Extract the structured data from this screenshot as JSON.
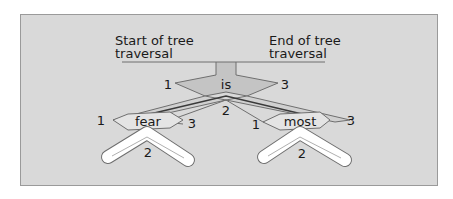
{
  "diagram": {
    "start_label_line1": "Start of tree",
    "start_label_line2": "traversal",
    "end_label_line1": "End of tree",
    "end_label_line2": "traversal",
    "nodes": [
      {
        "word": "is",
        "visits": [
          "1",
          "2",
          "3"
        ]
      },
      {
        "word": "fear",
        "visits": [
          "1",
          "2",
          "3"
        ]
      },
      {
        "word": "most",
        "visits": [
          "1",
          "2",
          "3"
        ]
      }
    ],
    "colors": {
      "background": "#d9d9d9",
      "trunk": "#bdbdbd",
      "node_fill": "#c4c4c4",
      "leaf_path": "#ffffff",
      "outline": "#6f6f6f",
      "traversal_line": "#3a3a3a"
    }
  }
}
